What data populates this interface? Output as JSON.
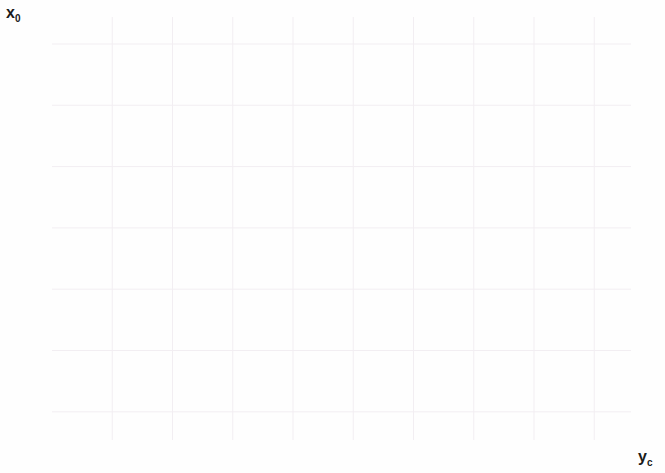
{
  "chart_data": {
    "type": "line",
    "title": "",
    "subtitle": "",
    "xlabel": "y_c",
    "ylabel": "x_0",
    "xlabel_base": "y",
    "xlabel_sub": "c",
    "ylabel_base": "x",
    "ylabel_sub": "0",
    "xlim": [
      0,
      0.1922
    ],
    "ylim": [
      0.27,
      3.72
    ],
    "grid": true,
    "grid_color": "#f2eef2",
    "legend_position": "right-inline-curve-labels",
    "axis_color": "#1a1a1a",
    "background": "#fefefe",
    "xticks": [
      0,
      0.02,
      0.04,
      0.06,
      0.08,
      0.1,
      0.12,
      0.14,
      0.16,
      0.18
    ],
    "xticklabels": [
      "0",
      "0.02",
      "0.04",
      "0.06",
      "0.08",
      "0.1",
      "0.12",
      "0.14",
      "0.16",
      "0.18"
    ],
    "yticks": [
      0.5,
      1,
      1.5,
      2,
      2.5,
      3,
      3.5
    ],
    "yticklabels": [
      "0.5",
      "1",
      "1.5",
      "2",
      "2.5",
      "3",
      "3.5"
    ],
    "series": [
      {
        "name": "1",
        "label": "1",
        "color": "#f08070",
        "label_x": 0.1905,
        "label_y": 0.6,
        "branches": [
          {
            "name": "lower",
            "points": [
              [
                0.0,
                0.705
              ],
              [
                0.02,
                0.697
              ],
              [
                0.04,
                0.687
              ],
              [
                0.06,
                0.675
              ],
              [
                0.08,
                0.661
              ],
              [
                0.1,
                0.645
              ],
              [
                0.12,
                0.625
              ],
              [
                0.14,
                0.601
              ],
              [
                0.155,
                0.58
              ],
              [
                0.17,
                0.553
              ],
              [
                0.18,
                0.529
              ],
              [
                0.186,
                0.51
              ],
              [
                0.1905,
                0.487
              ]
            ]
          },
          {
            "name": "upper",
            "points": [
              [
                0.1145,
                3.72
              ],
              [
                0.116,
                3.3
              ],
              [
                0.118,
                2.95
              ],
              [
                0.1205,
                2.6
              ],
              [
                0.123,
                2.33
              ],
              [
                0.126,
                2.07
              ],
              [
                0.13,
                1.82
              ],
              [
                0.135,
                1.58
              ],
              [
                0.141,
                1.36
              ],
              [
                0.148,
                1.16
              ],
              [
                0.156,
                0.99
              ],
              [
                0.164,
                0.855
              ],
              [
                0.172,
                0.745
              ],
              [
                0.179,
                0.655
              ],
              [
                0.185,
                0.57
              ],
              [
                0.1905,
                0.487
              ]
            ]
          }
        ]
      },
      {
        "name": "2",
        "label": "2",
        "color": "#66dd66",
        "label_x": 0.1905,
        "label_y": 0.97,
        "branches": [
          {
            "name": "lower",
            "points": [
              [
                0.0,
                1.415
              ],
              [
                0.02,
                1.397
              ],
              [
                0.04,
                1.377
              ],
              [
                0.06,
                1.353
              ],
              [
                0.08,
                1.325
              ],
              [
                0.1,
                1.293
              ],
              [
                0.12,
                1.253
              ],
              [
                0.14,
                1.205
              ],
              [
                0.155,
                1.16
              ],
              [
                0.17,
                1.1
              ],
              [
                0.18,
                1.04
              ],
              [
                0.186,
                0.985
              ],
              [
                0.1905,
                0.87
              ]
            ]
          },
          {
            "name": "upper",
            "points": [
              [
                0.1285,
                3.72
              ],
              [
                0.13,
                3.4
              ],
              [
                0.132,
                3.1
              ],
              [
                0.1345,
                2.83
              ],
              [
                0.137,
                2.6
              ],
              [
                0.14,
                2.38
              ],
              [
                0.144,
                2.15
              ],
              [
                0.149,
                1.92
              ],
              [
                0.154,
                1.73
              ],
              [
                0.16,
                1.55
              ],
              [
                0.166,
                1.4
              ],
              [
                0.172,
                1.26
              ],
              [
                0.178,
                1.14
              ],
              [
                0.184,
                1.02
              ],
              [
                0.188,
                0.935
              ],
              [
                0.1905,
                0.87
              ]
            ]
          }
        ]
      },
      {
        "name": "3",
        "label": "3",
        "color": "#7e93e8",
        "label_x": 0.1905,
        "label_y": 1.34,
        "branches": [
          {
            "name": "lower",
            "points": [
              [
                0.0,
                2.115
              ],
              [
                0.02,
                2.085
              ],
              [
                0.04,
                2.05
              ],
              [
                0.06,
                2.012
              ],
              [
                0.08,
                1.968
              ],
              [
                0.1,
                1.918
              ],
              [
                0.12,
                1.86
              ],
              [
                0.14,
                1.79
              ],
              [
                0.155,
                1.725
              ],
              [
                0.17,
                1.64
              ],
              [
                0.18,
                1.555
              ],
              [
                0.186,
                1.47
              ],
              [
                0.1905,
                1.22
              ]
            ]
          },
          {
            "name": "upper",
            "points": [
              [
                0.1385,
                3.72
              ],
              [
                0.14,
                3.42
              ],
              [
                0.142,
                3.14
              ],
              [
                0.1445,
                2.88
              ],
              [
                0.147,
                2.66
              ],
              [
                0.15,
                2.45
              ],
              [
                0.154,
                2.24
              ],
              [
                0.159,
                2.05
              ],
              [
                0.164,
                1.88
              ],
              [
                0.169,
                1.73
              ],
              [
                0.175,
                1.58
              ],
              [
                0.18,
                1.46
              ],
              [
                0.185,
                1.35
              ],
              [
                0.1885,
                1.275
              ],
              [
                0.1905,
                1.22
              ]
            ]
          }
        ]
      },
      {
        "name": "4",
        "label": "4",
        "color": "#f060c0",
        "label_x": 0.1905,
        "label_y": 1.72,
        "branches": [
          {
            "name": "lower",
            "points": [
              [
                0.0,
                2.81
              ],
              [
                0.02,
                2.768
              ],
              [
                0.04,
                2.722
              ],
              [
                0.06,
                2.672
              ],
              [
                0.08,
                2.615
              ],
              [
                0.1,
                2.55
              ],
              [
                0.12,
                2.475
              ],
              [
                0.14,
                2.385
              ],
              [
                0.155,
                2.3
              ],
              [
                0.17,
                2.19
              ],
              [
                0.18,
                2.075
              ],
              [
                0.186,
                1.95
              ],
              [
                0.1905,
                1.605
              ]
            ]
          },
          {
            "name": "upper",
            "points": [
              [
                0.1465,
                3.72
              ],
              [
                0.148,
                3.44
              ],
              [
                0.15,
                3.18
              ],
              [
                0.1525,
                2.94
              ],
              [
                0.155,
                2.73
              ],
              [
                0.158,
                2.54
              ],
              [
                0.162,
                2.35
              ],
              [
                0.166,
                2.19
              ],
              [
                0.171,
                2.03
              ],
              [
                0.176,
                1.89
              ],
              [
                0.181,
                1.77
              ],
              [
                0.185,
                1.68
              ],
              [
                0.1885,
                1.63
              ],
              [
                0.1905,
                1.605
              ]
            ]
          }
        ]
      },
      {
        "name": "5",
        "label": "5",
        "color": "#141414",
        "label_x": 0.1905,
        "label_y": 2.13,
        "branches": [
          {
            "name": "lower",
            "points": [
              [
                0.0,
                3.51
              ],
              [
                0.02,
                3.455
              ],
              [
                0.04,
                3.395
              ],
              [
                0.06,
                3.33
              ],
              [
                0.08,
                3.255
              ],
              [
                0.1,
                3.17
              ],
              [
                0.12,
                3.07
              ],
              [
                0.14,
                2.955
              ],
              [
                0.155,
                2.845
              ],
              [
                0.17,
                2.7
              ],
              [
                0.18,
                2.555
              ],
              [
                0.186,
                2.39
              ],
              [
                0.1905,
                1.965
              ]
            ]
          },
          {
            "name": "upper",
            "points": [
              [
                0.153,
                3.72
              ],
              [
                0.1545,
                3.48
              ],
              [
                0.1565,
                3.25
              ],
              [
                0.159,
                3.04
              ],
              [
                0.162,
                2.85
              ],
              [
                0.165,
                2.68
              ],
              [
                0.169,
                2.52
              ],
              [
                0.173,
                2.38
              ],
              [
                0.177,
                2.26
              ],
              [
                0.181,
                2.15
              ],
              [
                0.185,
                2.06
              ],
              [
                0.188,
                2.0
              ],
              [
                0.1905,
                1.965
              ]
            ]
          }
        ]
      }
    ]
  }
}
